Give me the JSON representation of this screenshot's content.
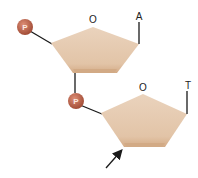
{
  "diagram": {
    "colors": {
      "sugar_fill": "#e4c7ab",
      "sugar_edge": "#d2aa85",
      "phosphate": "#b9604a",
      "line": "#1a1a1a"
    },
    "nucleotides": [
      {
        "ring_oxygen_label": "O",
        "base_label": "A",
        "phosphate_label": "P"
      },
      {
        "ring_oxygen_label": "O",
        "base_label": "T",
        "phosphate_label": "P"
      }
    ],
    "arrow": {
      "direction": "pointing-up-right",
      "target": "lower-left-vertex-of-second-sugar"
    }
  }
}
